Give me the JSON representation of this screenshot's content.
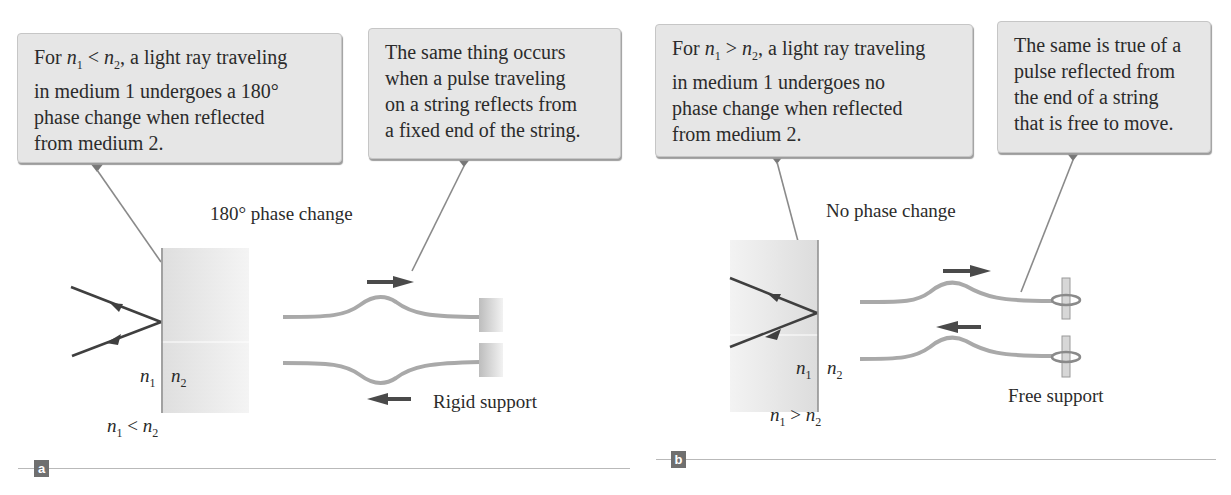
{
  "panels": [
    {
      "id": "a",
      "badge": "a",
      "callout_left": {
        "prefix": "For ",
        "n1": "n",
        "n1_sub": "1",
        "relation": " < ",
        "n2": "n",
        "n2_sub": "2",
        "rest_line1": ", a light ray traveling",
        "line2": "in medium 1 undergoes a 180°",
        "line3": "phase change when reflected",
        "line4": "from medium 2."
      },
      "callout_right": {
        "line1": "The same thing occurs",
        "line2": "when a pulse traveling",
        "line3": "on a string reflects from",
        "line4": "a fixed end of the string."
      },
      "phase_label": "180° phase change",
      "interface_n1": "n",
      "interface_n1_sub": "1",
      "interface_n2": "n",
      "interface_n2_sub": "2",
      "condition": {
        "a": "n",
        "a_sub": "1",
        "op": " < ",
        "b": "n",
        "b_sub": "2"
      },
      "support_label": "Rigid support"
    },
    {
      "id": "b",
      "badge": "b",
      "callout_left": {
        "prefix": "For ",
        "n1": "n",
        "n1_sub": "1",
        "relation": " > ",
        "n2": "n",
        "n2_sub": "2",
        "rest_line1": ", a light ray traveling",
        "line2": "in medium 1 undergoes no",
        "line3": "phase change when reflected",
        "line4": "from medium 2."
      },
      "callout_right": {
        "line1": "The same is true of a",
        "line2": "pulse reflected from",
        "line3": "the end of a string",
        "line4": "that is free to move."
      },
      "phase_label": "No phase change",
      "interface_n1": "n",
      "interface_n1_sub": "1",
      "interface_n2": "n",
      "interface_n2_sub": "2",
      "condition": {
        "a": "n",
        "a_sub": "1",
        "op": " > ",
        "b": "n",
        "b_sub": "2"
      },
      "support_label": "Free support"
    }
  ],
  "colors": {
    "callout_bg": "#e6e6e6",
    "pointer": "#777777",
    "ray": "#3f3f3f",
    "string": "#a9a9a9",
    "medium": "#e4e4e4",
    "badge": "#6f6f6f"
  }
}
